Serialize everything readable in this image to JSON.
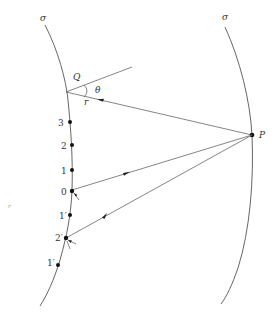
{
  "diagram": {
    "surfaces": [
      {
        "id": "left",
        "label": "σ"
      },
      {
        "id": "right",
        "label": "σ"
      }
    ],
    "points": {
      "Q": {
        "label": "Q"
      },
      "P": {
        "label": "P"
      }
    },
    "angle_label": "θ",
    "distance_label": "r",
    "left_points": [
      {
        "label": "3"
      },
      {
        "label": "2"
      },
      {
        "label": "1"
      },
      {
        "label": "0"
      },
      {
        "label": "1′"
      },
      {
        "label": "2′"
      },
      {
        "label": "1′"
      }
    ],
    "stray_mark": "r"
  }
}
